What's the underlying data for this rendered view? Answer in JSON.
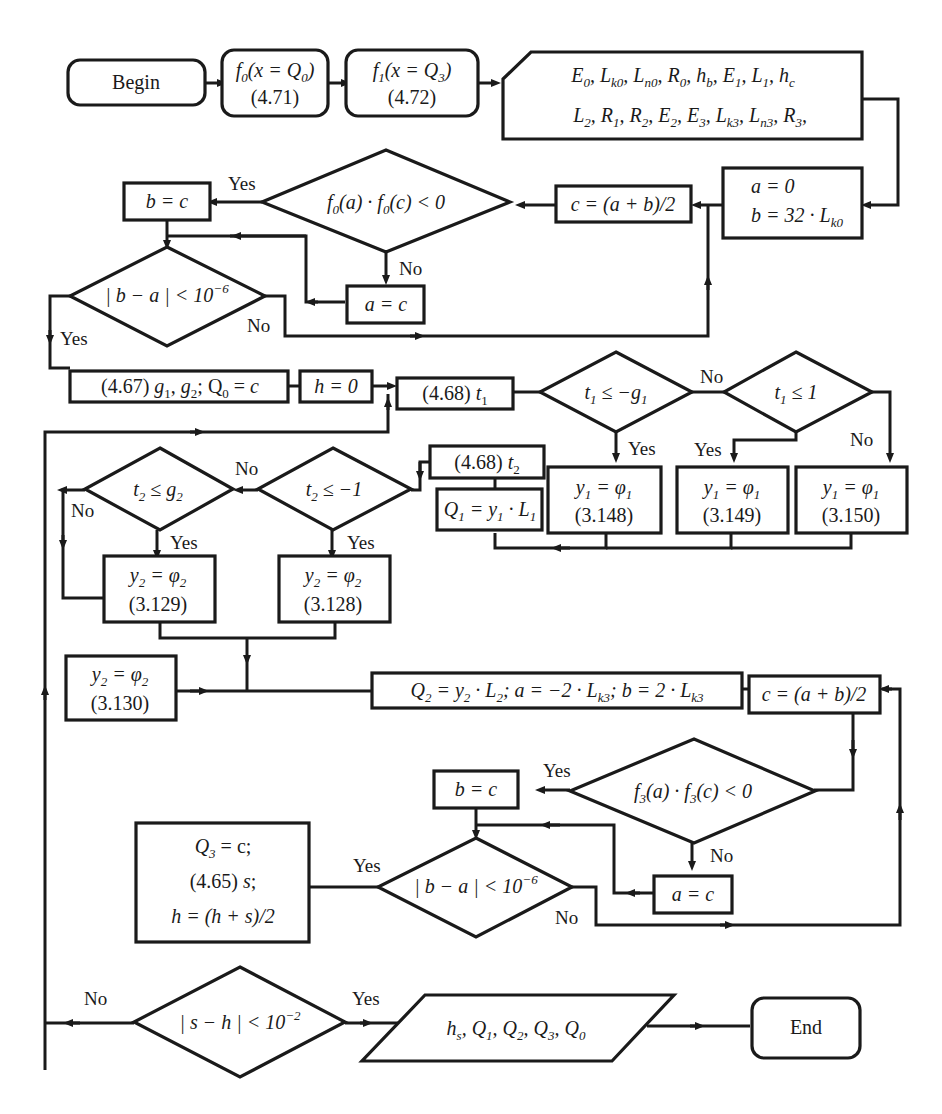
{
  "diagram": {
    "type": "flowchart",
    "colors": {
      "stroke": "#1a1a1a",
      "background": "#ffffff",
      "text": "#1a1a1a"
    },
    "labels": {
      "yes": "Yes",
      "no": "No"
    },
    "nodes": {
      "begin": {
        "label": "Begin",
        "shape": "terminal"
      },
      "f0": {
        "line1": "f0(x = Q0)",
        "line2": "(4.71)",
        "shape": "rounded-process"
      },
      "f1": {
        "line1": "f1(x = Q3)",
        "line2": "(4.72)",
        "shape": "rounded-process"
      },
      "input_params": {
        "line1": "E0, Lk0, Ln0, R0, hb, E1, L1, hc",
        "line2": "L2, R1, R2, E2, E3, Lk3, Ln3, R3,",
        "shape": "card-input"
      },
      "init1": {
        "line1": "a = 0",
        "line2": "b = 32 · Lk0",
        "shape": "process"
      },
      "mid1": {
        "label": "c = (a + b)/2",
        "shape": "process"
      },
      "cond_f0": {
        "label": "f0(a) · f0(c) < 0",
        "shape": "decision"
      },
      "b_eq_c_1": {
        "label": "b = c",
        "shape": "process"
      },
      "a_eq_c_1": {
        "label": "a = c",
        "shape": "process"
      },
      "conv1": {
        "label": "|b − a| < 10⁻⁶",
        "shape": "decision"
      },
      "g_calc": {
        "label": "(4.67) g1, g2; Q0 = c",
        "shape": "process"
      },
      "h_init": {
        "label": "h = 0",
        "shape": "process"
      },
      "t1_calc": {
        "label": "(4.68) t1",
        "shape": "process"
      },
      "cond_t1_g1": {
        "label": "t1 ≤ −g1",
        "shape": "decision"
      },
      "cond_t1_1": {
        "label": "t1 ≤ 1",
        "shape": "decision"
      },
      "y1_a": {
        "line1": "y1 = φ1",
        "line2": "(3.148)",
        "shape": "process"
      },
      "y1_b": {
        "line1": "y1 = φ1",
        "line2": "(3.149)",
        "shape": "process"
      },
      "y1_c": {
        "line1": "y1 = φ1",
        "line2": "(3.150)",
        "shape": "process"
      },
      "t2_calc": {
        "label": "(4.68) t2",
        "shape": "process"
      },
      "q1_calc": {
        "label": "Q1 = y1 · L1",
        "shape": "process"
      },
      "cond_t2_m1": {
        "label": "t2 ≤ −1",
        "shape": "decision"
      },
      "cond_t2_g2": {
        "label": "t2 ≤ g2",
        "shape": "decision"
      },
      "y2_a": {
        "line1": "y2 = φ2",
        "line2": "(3.129)",
        "shape": "process"
      },
      "y2_b": {
        "line1": "y2 = φ2",
        "line2": "(3.128)",
        "shape": "process"
      },
      "y2_c": {
        "line1": "y2 = φ2",
        "line2": "(3.130)",
        "shape": "process"
      },
      "q2_calc": {
        "label": "Q2 = y2 · L2;  a = −2 · Lk3;  b = 2 · Lk3",
        "shape": "process"
      },
      "mid2": {
        "label": "c = (a + b)/2",
        "shape": "process"
      },
      "cond_f3": {
        "label": "f3(a) · f3(c) < 0",
        "shape": "decision"
      },
      "b_eq_c_2": {
        "label": "b = c",
        "shape": "process"
      },
      "a_eq_c_2": {
        "label": "a = c",
        "shape": "process"
      },
      "conv2": {
        "label": "|b − a| < 10⁻⁶",
        "shape": "decision"
      },
      "q3_block": {
        "line1": "Q3 = c;",
        "line2": "(4.65) s;",
        "line3": "h = (h + s)/2",
        "shape": "process"
      },
      "conv3": {
        "label": "|s − h| < 10⁻²",
        "shape": "decision"
      },
      "output": {
        "label": "hs, Q1, Q2, Q3, Q0",
        "shape": "io-parallelogram"
      },
      "end": {
        "label": "End",
        "shape": "terminal"
      }
    }
  }
}
